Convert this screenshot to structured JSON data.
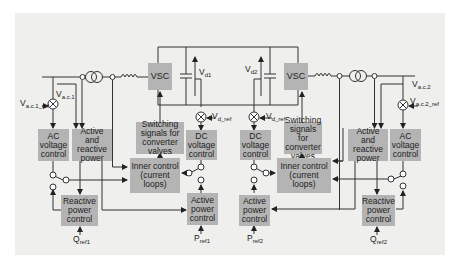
{
  "diagram": {
    "type": "VSC-HVDC control block diagram",
    "background_color": "#efefed",
    "block_color": "#b4b4b4",
    "line_color": "#333333",
    "station1": {
      "converter": "VSC",
      "dc_voltage": {
        "main": "V",
        "sub": "d1"
      },
      "dc_ref": {
        "main": "V",
        "sub": "d_ref"
      },
      "ac_voltage": {
        "main": "V",
        "sub": "a.c.1"
      },
      "ac_ref": {
        "main": "V",
        "sub": "a.c.1_ref"
      },
      "blocks": {
        "ac_voltage_control": "AC voltage control",
        "active_reactive_power": "Active and reactive power",
        "switching_signals": "Switching signals for converter valves",
        "dc_voltage_control": "DC voltage control",
        "inner_control": "Inner control (current loops)",
        "reactive_power_control": "Reactive power control",
        "active_power_control": "Active power control"
      },
      "q_ref": {
        "main": "Q",
        "sub": "ref1"
      },
      "p_ref": {
        "main": "P",
        "sub": "ref1"
      }
    },
    "station2": {
      "converter": "VSC",
      "dc_voltage": {
        "main": "V",
        "sub": "d2"
      },
      "dc_ref": {
        "main": "V",
        "sub": "d_ref"
      },
      "ac_voltage": {
        "main": "V",
        "sub": "a.c.2"
      },
      "ac_ref": {
        "main": "V",
        "sub": "a.c.2_ref"
      },
      "blocks": {
        "ac_voltage_control": "AC voltage control",
        "active_reactive_power": "Active and reactive power",
        "switching_signals": "Switching signals for converter valves",
        "dc_voltage_control": "DC voltage control",
        "inner_control": "Inner control (current loops)",
        "reactive_power_control": "Reactive power control",
        "active_power_control": "Active power control"
      },
      "q_ref": {
        "main": "Q",
        "sub": "ref2"
      },
      "p_ref": {
        "main": "P",
        "sub": "ref2"
      }
    }
  }
}
